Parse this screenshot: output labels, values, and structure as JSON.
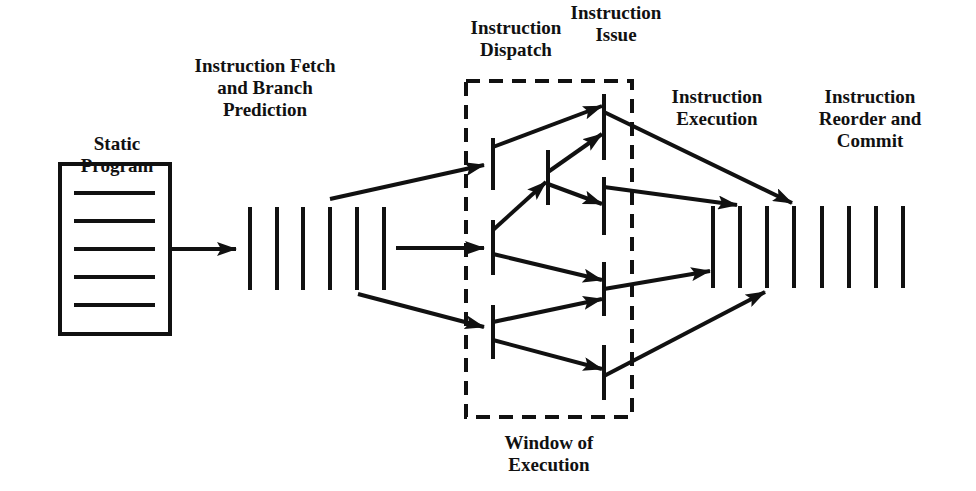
{
  "diagram": {
    "labels": {
      "static_program": [
        "Static",
        "Program"
      ],
      "fetch": [
        "Instruction Fetch",
        "and  Branch",
        "Prediction"
      ],
      "dispatch": [
        "Instruction",
        "Dispatch"
      ],
      "issue": [
        "Instruction",
        "Issue"
      ],
      "execution": [
        "Instruction",
        "Execution"
      ],
      "reorder": [
        "Instruction",
        "Reorder and",
        "Commit"
      ],
      "window": [
        "Window of",
        "Execution"
      ]
    },
    "colors": {
      "ink": "#111111",
      "background": "#ffffff"
    }
  }
}
